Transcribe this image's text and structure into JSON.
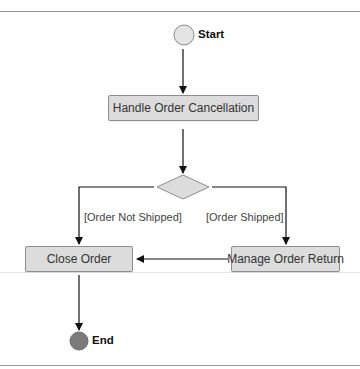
{
  "diagram": {
    "type": "UML activity diagram",
    "start": {
      "label": "Start"
    },
    "end": {
      "label": "End"
    },
    "activities": [
      {
        "id": "handle",
        "label": "Handle Order Cancellation"
      },
      {
        "id": "close",
        "label": "Close Order"
      },
      {
        "id": "return",
        "label": "Manage Order Return"
      }
    ],
    "decision": {
      "guards": {
        "left": "[Order Not Shipped]",
        "right": "[Order Shipped]"
      }
    },
    "edges": [
      {
        "from": "Start",
        "to": "Handle Order Cancellation"
      },
      {
        "from": "Handle Order Cancellation",
        "to": "decision"
      },
      {
        "from": "decision",
        "to": "Close Order",
        "guard": "[Order Not Shipped]"
      },
      {
        "from": "decision",
        "to": "Manage Order Return",
        "guard": "[Order Shipped]"
      },
      {
        "from": "Manage Order Return",
        "to": "Close Order"
      },
      {
        "from": "Close Order",
        "to": "End"
      }
    ],
    "colors": {
      "node_fill": "#dcdcdc",
      "node_border": "#8e8e8e",
      "start_fill": "#e4e4e4",
      "end_fill": "#7a7a7a",
      "edge": "#111111"
    }
  }
}
